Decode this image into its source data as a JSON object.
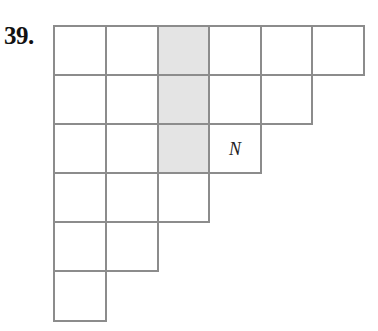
{
  "problem_label": "39.",
  "grid": {
    "left": 53,
    "top": 25,
    "col_x": [
      53,
      105,
      157,
      208,
      260,
      311,
      363
    ],
    "row_y": [
      25,
      74,
      123,
      172,
      221,
      270,
      320
    ],
    "row_lengths": [
      6,
      5,
      4,
      3,
      2,
      1
    ],
    "shaded_cells": [
      [
        0,
        2
      ],
      [
        1,
        2
      ],
      [
        2,
        2
      ]
    ],
    "labels": [
      {
        "row": 2,
        "col": 3,
        "text": "N"
      }
    ],
    "colors": {
      "line": "#8c8c8c",
      "shade": "#e4e4e4"
    }
  }
}
